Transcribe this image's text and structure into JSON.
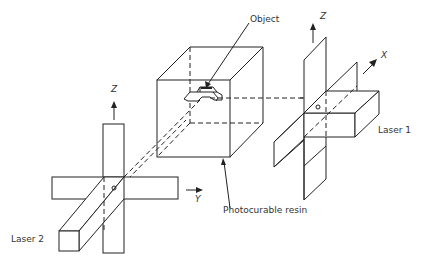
{
  "diagram": {
    "type": "technical-illustration",
    "labels": {
      "object": "Object",
      "resin": "Photocurable resin",
      "laser1": "Laser 1",
      "laser2": "Laser 2"
    },
    "axes": {
      "z_laser1": "Z",
      "z_laser2": "Z",
      "x": "X",
      "y": "Y"
    },
    "colors": {
      "line": "#222222",
      "text": "#333333",
      "background": "#ffffff"
    }
  }
}
